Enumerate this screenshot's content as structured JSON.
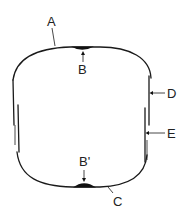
{
  "diagram": {
    "type": "cross-section schematic",
    "labels": {
      "A": "A",
      "B": "B",
      "B_prime": "B'",
      "C": "C",
      "D": "D",
      "E": "E"
    },
    "colors": {
      "line": "#1a1a1a",
      "background": "#ffffff"
    }
  }
}
